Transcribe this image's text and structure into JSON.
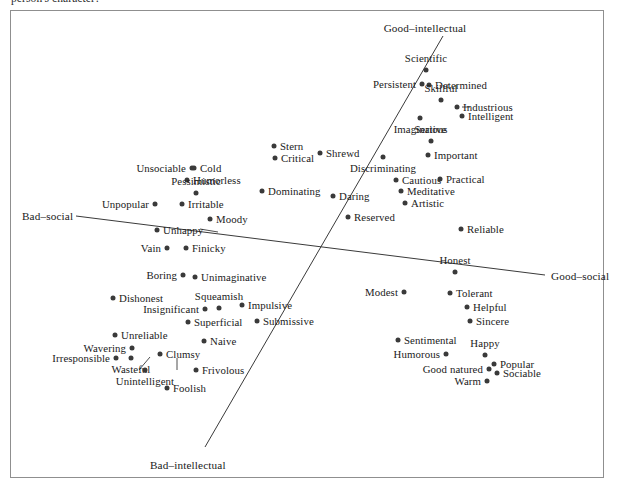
{
  "caption_fragment": "person's character?",
  "frame": {
    "x": 10,
    "y": 10,
    "width": 594,
    "height": 468,
    "border_color": "#8f8f8f"
  },
  "style": {
    "dot_color": "#3a3a3a",
    "line_color": "#3a3a3a",
    "text_color": "#1a1a1a",
    "background": "#ffffff"
  },
  "chart_data": {
    "type": "scatter",
    "title": "",
    "subtitle": "",
    "xlabel": "Bad-social – Good-social",
    "ylabel": "Bad-intellectual – Good-intellectual",
    "grid": false,
    "legend": "none",
    "axis_lines": [
      {
        "name": "social-axis",
        "from_label": "Bad-social",
        "to_label": "Good-social",
        "x1": 76,
        "y1": 216,
        "x2": 545,
        "y2": 275
      },
      {
        "name": "intellectual-axis",
        "from_label": "Bad-intellectual",
        "to_label": "Good-intellectual",
        "x1": 205,
        "y1": 447,
        "x2": 443,
        "y2": 36
      }
    ],
    "axis_labels": [
      {
        "name": "good-intellectual-label",
        "text": "Good–intellectual",
        "x": 425,
        "y": 28,
        "anchor": "center"
      },
      {
        "name": "bad-intellectual-label",
        "text": "Bad–intellectual",
        "x": 150,
        "y": 465,
        "anchor": "left"
      },
      {
        "name": "bad-social-label",
        "text": "Bad–social",
        "x": 22,
        "y": 216,
        "anchor": "left"
      },
      {
        "name": "good-social-label",
        "text": "Good–social",
        "x": 551,
        "y": 276,
        "anchor": "left"
      }
    ],
    "leaders": [
      {
        "name": "unhappy-leader",
        "x1": 200,
        "y1": 229,
        "x2": 218,
        "y2": 232
      },
      {
        "name": "industrious-leader",
        "x1": 462,
        "y1": 107,
        "x2": 470,
        "y2": 107
      },
      {
        "name": "wasteful-leader",
        "x1": 139,
        "y1": 370,
        "x2": 150,
        "y2": 357
      },
      {
        "name": "unintelligent-leader",
        "x1": 177,
        "y1": 370,
        "x2": 177,
        "y2": 358
      }
    ],
    "points": [
      {
        "label": "Scientific",
        "x": 426,
        "y": 70,
        "anchor": "t"
      },
      {
        "label": "Persistent",
        "x": 422,
        "y": 84,
        "anchor": "l"
      },
      {
        "label": "Determined",
        "x": 429,
        "y": 85,
        "anchor": "r"
      },
      {
        "label": "Skillful",
        "x": 441,
        "y": 100,
        "anchor": "t"
      },
      {
        "label": "Industrious",
        "x": 457,
        "y": 107,
        "anchor": "r"
      },
      {
        "label": "Intelligent",
        "x": 462,
        "y": 116,
        "anchor": "r"
      },
      {
        "label": "Imaginative",
        "x": 420,
        "y": 118,
        "anchor": "b"
      },
      {
        "label": "Serious",
        "x": 431,
        "y": 141,
        "anchor": "t"
      },
      {
        "label": "Important",
        "x": 428,
        "y": 155,
        "anchor": "r"
      },
      {
        "label": "Stern",
        "x": 274,
        "y": 146,
        "anchor": "r"
      },
      {
        "label": "Shrewd",
        "x": 320,
        "y": 153,
        "anchor": "r"
      },
      {
        "label": "Critical",
        "x": 275,
        "y": 158,
        "anchor": "r"
      },
      {
        "label": "Discriminating",
        "x": 383,
        "y": 157,
        "anchor": "b"
      },
      {
        "label": "Cautious",
        "x": 396,
        "y": 180,
        "anchor": "r"
      },
      {
        "label": "Practical",
        "x": 440,
        "y": 179,
        "anchor": "r"
      },
      {
        "label": "Dominating",
        "x": 262,
        "y": 191,
        "anchor": "r"
      },
      {
        "label": "Daring",
        "x": 333,
        "y": 196,
        "anchor": "r"
      },
      {
        "label": "Meditative",
        "x": 401,
        "y": 191,
        "anchor": "r"
      },
      {
        "label": "Artistic",
        "x": 405,
        "y": 203,
        "anchor": "r"
      },
      {
        "label": "Reserved",
        "x": 348,
        "y": 217,
        "anchor": "r"
      },
      {
        "label": "Reliable",
        "x": 461,
        "y": 229,
        "anchor": "r"
      },
      {
        "label": "Unsociable",
        "x": 192,
        "y": 168,
        "anchor": "l"
      },
      {
        "label": "Cold",
        "x": 194,
        "y": 168,
        "anchor": "r"
      },
      {
        "label": "Humorless",
        "x": 187,
        "y": 180,
        "anchor": "r"
      },
      {
        "label": "Pessimistic",
        "x": 196,
        "y": 193,
        "anchor": "t"
      },
      {
        "label": "Unpopular",
        "x": 155,
        "y": 204,
        "anchor": "l"
      },
      {
        "label": "Irritable",
        "x": 182,
        "y": 204,
        "anchor": "r"
      },
      {
        "label": "Moody",
        "x": 210,
        "y": 219,
        "anchor": "r"
      },
      {
        "label": "Unhappy",
        "x": 157,
        "y": 230,
        "anchor": "r"
      },
      {
        "label": "Vain",
        "x": 167,
        "y": 248,
        "anchor": "l"
      },
      {
        "label": "Finicky",
        "x": 186,
        "y": 248,
        "anchor": "r"
      },
      {
        "label": "Honest",
        "x": 455,
        "y": 272,
        "anchor": "t"
      },
      {
        "label": "Boring",
        "x": 183,
        "y": 275,
        "anchor": "l"
      },
      {
        "label": "Unimaginative",
        "x": 195,
        "y": 277,
        "anchor": "r"
      },
      {
        "label": "Modest",
        "x": 404,
        "y": 292,
        "anchor": "l"
      },
      {
        "label": "Tolerant",
        "x": 450,
        "y": 293,
        "anchor": "r"
      },
      {
        "label": "Dishonest",
        "x": 113,
        "y": 298,
        "anchor": "r"
      },
      {
        "label": "Squeamish",
        "x": 219,
        "y": 308,
        "anchor": "t"
      },
      {
        "label": "Impulsive",
        "x": 242,
        "y": 305,
        "anchor": "r"
      },
      {
        "label": "Helpful",
        "x": 467,
        "y": 307,
        "anchor": "r"
      },
      {
        "label": "Insignificant",
        "x": 205,
        "y": 309,
        "anchor": "l"
      },
      {
        "label": "Superficial",
        "x": 188,
        "y": 322,
        "anchor": "r"
      },
      {
        "label": "Submissive",
        "x": 257,
        "y": 321,
        "anchor": "r"
      },
      {
        "label": "Sincere",
        "x": 470,
        "y": 321,
        "anchor": "r"
      },
      {
        "label": "Unreliable",
        "x": 115,
        "y": 335,
        "anchor": "r"
      },
      {
        "label": "Naive",
        "x": 204,
        "y": 341,
        "anchor": "r"
      },
      {
        "label": "Sentimental",
        "x": 398,
        "y": 340,
        "anchor": "r"
      },
      {
        "label": "Wavering",
        "x": 132,
        "y": 348,
        "anchor": "l"
      },
      {
        "label": "Clumsy",
        "x": 160,
        "y": 354,
        "anchor": "r"
      },
      {
        "label": "Happy",
        "x": 485,
        "y": 355,
        "anchor": "t"
      },
      {
        "label": "Humorous",
        "x": 446,
        "y": 354,
        "anchor": "l"
      },
      {
        "label": "Irresponsible",
        "x": 116,
        "y": 358,
        "anchor": "l"
      },
      {
        "label": "Popular",
        "x": 494,
        "y": 364,
        "anchor": "r"
      },
      {
        "label": "Wasteful",
        "x": 131,
        "y": 358,
        "anchor": "b"
      },
      {
        "label": "Good natured",
        "x": 489,
        "y": 369,
        "anchor": "l"
      },
      {
        "label": "Sociable",
        "x": 497,
        "y": 373,
        "anchor": "r"
      },
      {
        "label": "Frivolous",
        "x": 196,
        "y": 370,
        "anchor": "r"
      },
      {
        "label": "Unintelligent",
        "x": 145,
        "y": 370,
        "anchor": "b"
      },
      {
        "label": "Warm",
        "x": 487,
        "y": 381,
        "anchor": "l"
      },
      {
        "label": "Foolish",
        "x": 167,
        "y": 388,
        "anchor": "r"
      }
    ]
  }
}
